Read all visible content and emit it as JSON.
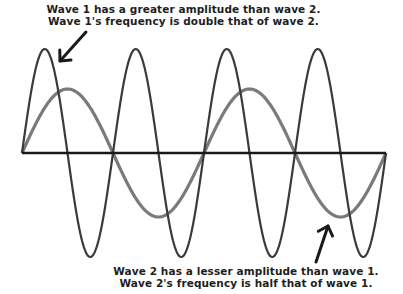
{
  "top_caption": {
    "line1": "Wave 1 has a greater amplitude than wave 2.",
    "line2": "Wave 1's frequency is double that of wave 2."
  },
  "bottom_caption": {
    "line1": "Wave 2 has a lesser amplitude than wave 1.",
    "line2": "Wave 2's frequency is half that of wave 1."
  },
  "waves": [
    {
      "name": "Wave 1",
      "cycles": 4,
      "amplitude_px": 104,
      "color": "#3a3a3a",
      "stroke_width": 2.2
    },
    {
      "name": "Wave 2",
      "cycles": 2,
      "amplitude_px": 64,
      "color": "#7a7a7a",
      "stroke_width": 3.2
    }
  ],
  "axis": {
    "x_start": 22,
    "x_end": 386,
    "y": 153,
    "color": "#1a1a1a"
  },
  "arrows": [
    {
      "label": "arrow-to-wave-1",
      "from": [
        86,
        32
      ],
      "to": [
        60,
        61
      ]
    },
    {
      "label": "arrow-to-wave-2",
      "from": [
        316,
        262
      ],
      "to": [
        328,
        226
      ]
    }
  ]
}
